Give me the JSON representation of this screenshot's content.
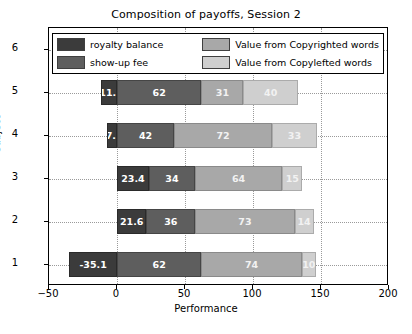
{
  "chart_data": {
    "type": "bar",
    "orientation": "horizontal",
    "stacked": true,
    "title": "Composition of payoffs, Session 2",
    "xlabel": "Performance",
    "ylabel": "subject",
    "xlim": [
      -50,
      200
    ],
    "xticks": [
      -50,
      0,
      50,
      100,
      150,
      200
    ],
    "ylim": [
      0.4,
      6.6
    ],
    "categories": [
      "1",
      "2",
      "3",
      "4",
      "5",
      "6"
    ],
    "yticks": [
      "1",
      "2",
      "3",
      "4",
      "5",
      "6"
    ],
    "grid": true,
    "legend_position": "upper center",
    "series": [
      {
        "name": "royalty balance",
        "color": "#3b3b3b",
        "values": [
          -35.1,
          21.6,
          23.4,
          -7.2,
          -11.7,
          9.0
        ],
        "labels": [
          "-35.1",
          "21.6",
          "23.4",
          "-7.2",
          "-11.7",
          "9.0"
        ]
      },
      {
        "name": "show-up fee",
        "color": "#5e5e5e",
        "values": [
          62,
          36,
          34,
          42,
          62,
          46
        ],
        "labels": [
          "62",
          "36",
          "34",
          "42",
          "62",
          "46"
        ]
      },
      {
        "name": "Value from Copyrighted words",
        "color": "#a8a8a8",
        "values": [
          74,
          73,
          64,
          72,
          31,
          72
        ],
        "labels": [
          "74",
          "73",
          "64",
          "72",
          "31",
          "72"
        ]
      },
      {
        "name": "Value from Copylefted words",
        "color": "#cfcfcf",
        "values": [
          10,
          14,
          15,
          33,
          40,
          50
        ],
        "labels": [
          "10",
          "14",
          "15",
          "33",
          "40",
          "50"
        ]
      }
    ]
  },
  "legend": {
    "items": [
      {
        "label": "royalty balance",
        "color": "#3b3b3b"
      },
      {
        "label": "Value from Copyrighted words",
        "color": "#a8a8a8"
      },
      {
        "label": "show-up fee",
        "color": "#5e5e5e"
      },
      {
        "label": "Value from Copylefted words",
        "color": "#cfcfcf"
      }
    ]
  }
}
